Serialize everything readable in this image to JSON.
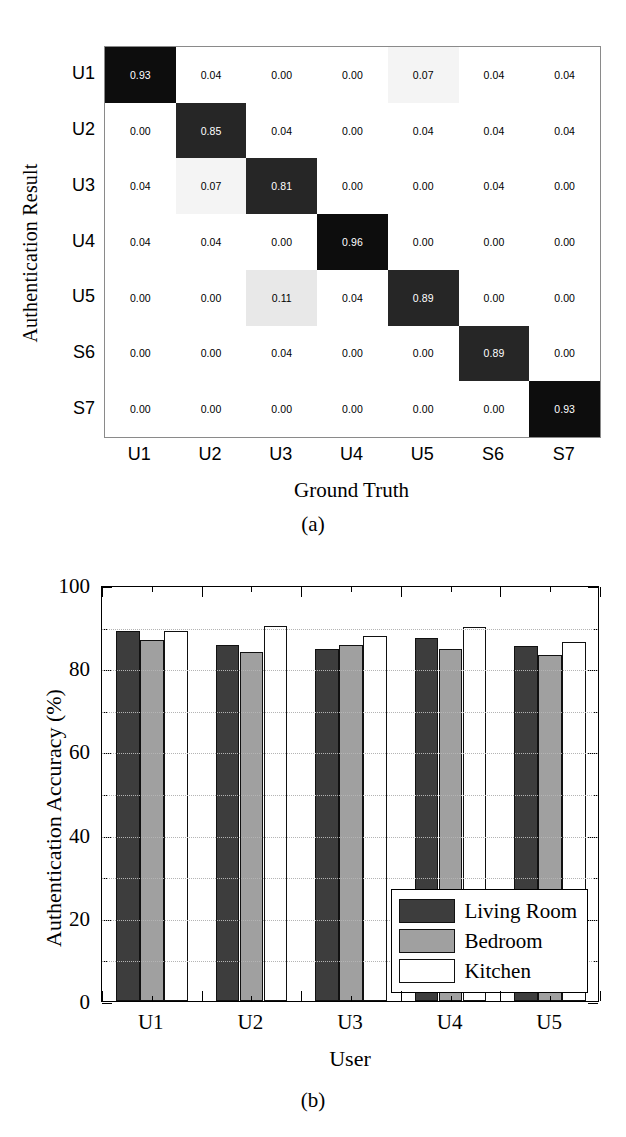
{
  "figure": {
    "caption_a": "(a)",
    "caption_b": "(b)"
  },
  "panel_a": {
    "ylabel": "Authentication Result",
    "xlabel": "Ground Truth",
    "row_labels": [
      "U1",
      "U2",
      "U3",
      "U4",
      "U5",
      "S6",
      "S7"
    ],
    "col_labels": [
      "U1",
      "U2",
      "U3",
      "U4",
      "U5",
      "S6",
      "S7"
    ]
  },
  "panel_b": {
    "ylabel": "Authentication Accuracy (%)",
    "xlabel": "User",
    "ytick_labels": [
      "100",
      "80",
      "60",
      "40",
      "20",
      "0"
    ],
    "ytick_values": [
      100,
      80,
      60,
      40,
      20,
      0
    ],
    "legend": [
      {
        "label": "Living Room",
        "key": "living",
        "color": "#3d3d3d"
      },
      {
        "label": "Bedroom",
        "key": "bedroom",
        "color": "#a0a0a0"
      },
      {
        "label": "Kitchen",
        "key": "kitchen",
        "color": "#ffffff"
      }
    ]
  },
  "chart_data": [
    {
      "type": "heatmap",
      "subfigure": "(a)",
      "title": "",
      "xlabel": "Ground Truth",
      "ylabel": "Authentication Result",
      "x_categories": [
        "U1",
        "U2",
        "U3",
        "U4",
        "U5",
        "S6",
        "S7"
      ],
      "y_categories": [
        "U1",
        "U2",
        "U3",
        "U4",
        "U5",
        "S6",
        "S7"
      ],
      "cell_text_format": "0.00",
      "grid": true,
      "legend": "none",
      "values": [
        [
          0.93,
          0.04,
          0.0,
          0.0,
          0.07,
          0.04,
          0.04
        ],
        [
          0.0,
          0.85,
          0.04,
          0.0,
          0.04,
          0.04,
          0.04
        ],
        [
          0.04,
          0.07,
          0.81,
          0.0,
          0.0,
          0.04,
          0.0
        ],
        [
          0.04,
          0.04,
          0.0,
          0.96,
          0.0,
          0.0,
          0.0
        ],
        [
          0.0,
          0.0,
          0.11,
          0.04,
          0.89,
          0.0,
          0.0
        ],
        [
          0.0,
          0.0,
          0.04,
          0.0,
          0.0,
          0.89,
          0.0
        ],
        [
          0.0,
          0.0,
          0.0,
          0.0,
          0.0,
          0.0,
          0.93
        ]
      ],
      "cell_labels": [
        [
          "0.93",
          "0.04",
          "0.00",
          "0.00",
          "0.07",
          "0.04",
          "0.04"
        ],
        [
          "0.00",
          "0.85",
          "0.04",
          "0.00",
          "0.04",
          "0.04",
          "0.04"
        ],
        [
          "0.04",
          "0.07",
          "0.81",
          "0.00",
          "0.00",
          "0.04",
          "0.00"
        ],
        [
          "0.04",
          "0.04",
          "0.00",
          "0.96",
          "0.00",
          "0.00",
          "0.00"
        ],
        [
          "0.00",
          "0.00",
          "0.11",
          "0.04",
          "0.89",
          "0.00",
          "0.00"
        ],
        [
          "0.00",
          "0.00",
          "0.04",
          "0.00",
          "0.00",
          "0.89",
          "0.00"
        ],
        [
          "0.00",
          "0.00",
          "0.00",
          "0.00",
          "0.00",
          "0.00",
          "0.93"
        ]
      ]
    },
    {
      "type": "bar",
      "subfigure": "(b)",
      "title": "",
      "xlabel": "User",
      "ylabel": "Authentication Accuracy (%)",
      "categories": [
        "U1",
        "U2",
        "U3",
        "U4",
        "U5"
      ],
      "ylim": [
        0,
        100
      ],
      "ytick_step": 20,
      "minor_tick_step": 10,
      "grid": true,
      "legend_position": "bottom-right",
      "reference_line": 90,
      "series": [
        {
          "name": "Living Room",
          "color": "#3d3d3d",
          "values": [
            89.0,
            85.5,
            84.5,
            87.2,
            85.3
          ]
        },
        {
          "name": "Bedroom",
          "color": "#a0a0a0",
          "values": [
            86.8,
            84.0,
            85.7,
            84.6,
            83.2
          ]
        },
        {
          "name": "Kitchen",
          "color": "#ffffff",
          "values": [
            89.0,
            90.2,
            87.8,
            89.8,
            86.2
          ]
        }
      ]
    }
  ]
}
